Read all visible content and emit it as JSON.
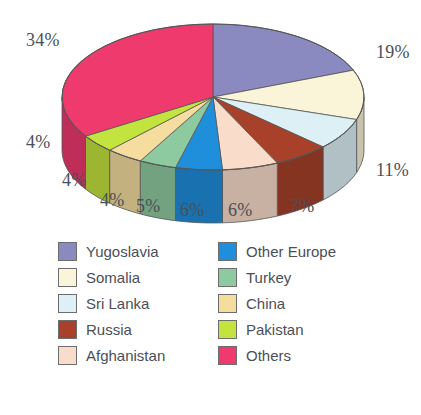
{
  "chart_data": {
    "type": "pie",
    "title": "",
    "subtitle": "",
    "xlabel": "",
    "ylabel": "",
    "legend_position": "bottom",
    "three_d": true,
    "start_angle_deg": 0,
    "direction": "clockwise",
    "categories": [
      "Yugoslavia",
      "Somalia",
      "Sri Lanka",
      "Russia",
      "Afghanistan",
      "Other Europe",
      "Turkey",
      "China",
      "Pakistan",
      "Others"
    ],
    "values": [
      19,
      11,
      7,
      6,
      6,
      5,
      4,
      4,
      4,
      34
    ],
    "value_unit": "%",
    "data_labels": [
      "19%",
      "11%",
      "7%",
      "6%",
      "6%",
      "5%",
      "4%",
      "4%",
      "4%",
      "34%"
    ],
    "colors": [
      "#8a8ac0",
      "#faf4d8",
      "#dcf0f5",
      "#a8412a",
      "#fadccb",
      "#1f8fdb",
      "#8ecaa0",
      "#f5dda0",
      "#c3e33e",
      "#ef3a6e"
    ],
    "slices": [
      {
        "label": "Yugoslavia",
        "value": 19,
        "display": "19%",
        "color": "#8a8ac0"
      },
      {
        "label": "Somalia",
        "value": 11,
        "display": "11%",
        "color": "#faf4d8"
      },
      {
        "label": "Sri Lanka",
        "value": 7,
        "display": "7%",
        "color": "#dcf0f5"
      },
      {
        "label": "Russia",
        "value": 6,
        "display": "6%",
        "color": "#a8412a"
      },
      {
        "label": "Afghanistan",
        "value": 6,
        "display": "6%",
        "color": "#fadccb"
      },
      {
        "label": "Other Europe",
        "value": 5,
        "display": "5%",
        "color": "#1f8fdb"
      },
      {
        "label": "Turkey",
        "value": 4,
        "display": "4%",
        "color": "#8ecaa0"
      },
      {
        "label": "China",
        "value": 4,
        "display": "4%",
        "color": "#f5dda0"
      },
      {
        "label": "Pakistan",
        "value": 4,
        "display": "4%",
        "color": "#c3e33e"
      },
      {
        "label": "Others",
        "value": 34,
        "display": "34%",
        "color": "#ef3a6e"
      }
    ]
  },
  "callouts": [
    {
      "text": "34%",
      "x": 26,
      "y": 30
    },
    {
      "text": "19%",
      "x": 376,
      "y": 42
    },
    {
      "text": "11%",
      "x": 376,
      "y": 160
    },
    {
      "text": "7%",
      "x": 290,
      "y": 196
    },
    {
      "text": "6%",
      "x": 228,
      "y": 200
    },
    {
      "text": "6%",
      "x": 180,
      "y": 200
    },
    {
      "text": "5%",
      "x": 136,
      "y": 196
    },
    {
      "text": "4%",
      "x": 100,
      "y": 190
    },
    {
      "text": "4%",
      "x": 62,
      "y": 170
    },
    {
      "text": "4%",
      "x": 26,
      "y": 132
    }
  ],
  "legend": {
    "columns": 2,
    "column_left": [
      {
        "label": "Yugoslavia",
        "color": "#8a8ac0"
      },
      {
        "label": "Somalia",
        "color": "#faf4d8"
      },
      {
        "label": "Sri Lanka",
        "color": "#dcf0f5"
      },
      {
        "label": "Russia",
        "color": "#a8412a"
      },
      {
        "label": "Afghanistan",
        "color": "#fadccb"
      }
    ],
    "column_right": [
      {
        "label": "Other Europe",
        "color": "#1f8fdb"
      },
      {
        "label": "Turkey",
        "color": "#8ecaa0"
      },
      {
        "label": "China",
        "color": "#f5dda0"
      },
      {
        "label": "Pakistan",
        "color": "#c3e33e"
      },
      {
        "label": "Others",
        "color": "#ef3a6e"
      }
    ]
  },
  "style": {
    "background": "#ffffff",
    "text_color": "#4a4f57",
    "outline_color": "#555555"
  }
}
